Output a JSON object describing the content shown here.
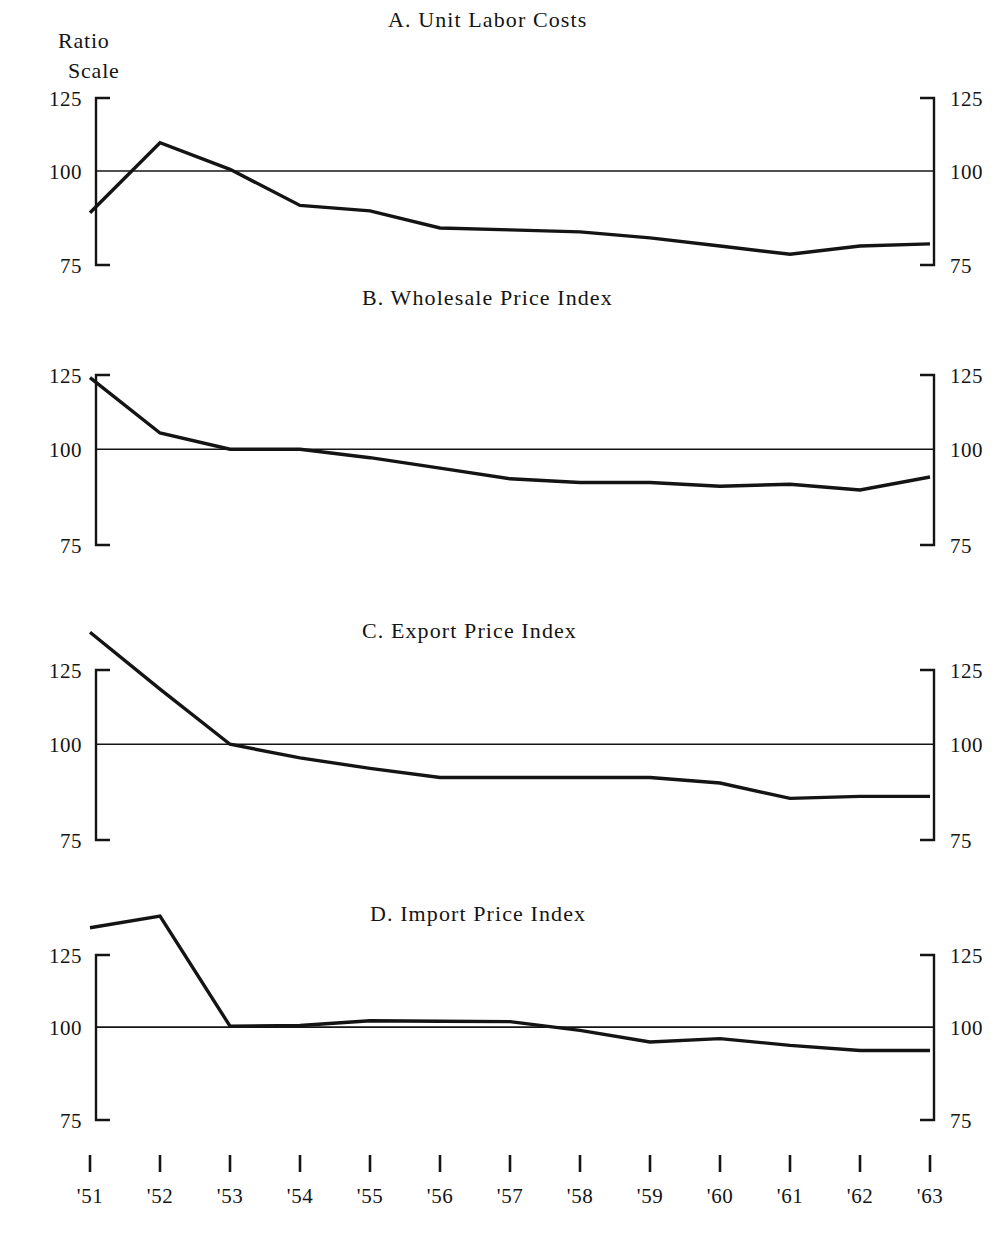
{
  "figure": {
    "background_color": "#ffffff",
    "ink_color": "#141414",
    "scale_caption_line1": "Ratio",
    "scale_caption_line2": "Scale"
  },
  "chart_data": [
    {
      "type": "line",
      "title": "A.  Unit Labor Costs",
      "panel": "A",
      "xlabel": "",
      "ylabel": "Ratio Scale",
      "scale": "log",
      "ylim": [
        75,
        125
      ],
      "yticks": [
        75,
        100,
        125
      ],
      "ytick_labels": [
        "75",
        "100",
        "125"
      ],
      "grid": false,
      "reference_line": 100,
      "legend": "none",
      "x": [
        "'51",
        "'52",
        "'53",
        "'54",
        "'55",
        "'56",
        "'57",
        "'58",
        "'59",
        "'60",
        "'61",
        "'62",
        "'63"
      ],
      "values": [
        88,
        109,
        100.5,
        90,
        88.5,
        84,
        83.5,
        83,
        81.5,
        79.5,
        77.5,
        79.5,
        80
      ]
    },
    {
      "type": "line",
      "title": "B.  Wholesale Price Index",
      "panel": "B",
      "xlabel": "",
      "ylabel": "Ratio Scale",
      "scale": "log",
      "ylim": [
        75,
        125
      ],
      "yticks": [
        75,
        100,
        125
      ],
      "ytick_labels": [
        "75",
        "100",
        "125"
      ],
      "grid": false,
      "reference_line": 100,
      "legend": "none",
      "x": [
        "'51",
        "'52",
        "'53",
        "'54",
        "'55",
        "'56",
        "'57",
        "'58",
        "'59",
        "'60",
        "'61",
        "'62",
        "'63"
      ],
      "values": [
        124,
        105,
        100,
        100,
        97.5,
        94.5,
        91.5,
        90.5,
        90.5,
        89.5,
        90,
        88.5,
        92
      ]
    },
    {
      "type": "line",
      "title": "C.  Export Price Index",
      "panel": "C",
      "xlabel": "",
      "ylabel": "Ratio Scale",
      "scale": "log",
      "ylim": [
        75,
        125
      ],
      "yticks": [
        75,
        100,
        125
      ],
      "ytick_labels": [
        "75",
        "100",
        "125"
      ],
      "grid": false,
      "reference_line": 100,
      "legend": "none",
      "x": [
        "'51",
        "'52",
        "'53",
        "'54",
        "'55",
        "'56",
        "'57",
        "'58",
        "'59",
        "'60",
        "'61",
        "'62",
        "'63"
      ],
      "values": [
        140,
        118,
        100,
        96,
        93,
        90.5,
        90.5,
        90.5,
        90.5,
        89,
        85,
        85.5,
        85.5
      ]
    },
    {
      "type": "line",
      "title": "D.  Import Price Index",
      "panel": "D",
      "xlabel": "",
      "ylabel": "Ratio Scale",
      "scale": "log",
      "ylim": [
        75,
        125
      ],
      "yticks": [
        75,
        100,
        125
      ],
      "ytick_labels": [
        "75",
        "100",
        "125"
      ],
      "grid": false,
      "reference_line": 100,
      "legend": "none",
      "x": [
        "'51",
        "'52",
        "'53",
        "'54",
        "'55",
        "'56",
        "'57",
        "'58",
        "'59",
        "'60",
        "'61",
        "'62",
        "'63"
      ],
      "values": [
        136,
        141,
        100.3,
        100.5,
        102,
        101.8,
        101.7,
        99,
        95.5,
        96.5,
        94.5,
        93,
        93
      ]
    }
  ],
  "axis": {
    "x_tick_labels": [
      "'51",
      "'52",
      "'53",
      "'54",
      "'55",
      "'56",
      "'57",
      "'58",
      "'59",
      "'60",
      "'61",
      "'62",
      "'63"
    ],
    "y_tick_labels": [
      "125",
      "100",
      "75"
    ]
  }
}
